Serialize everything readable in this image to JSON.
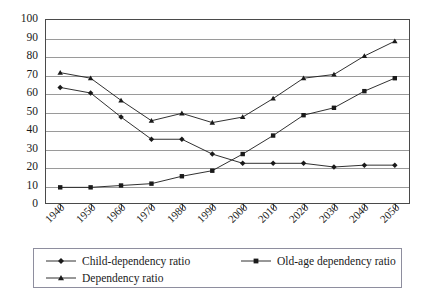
{
  "chart_data": {
    "type": "line",
    "title": "",
    "xlabel": "",
    "ylabel": "",
    "ylim": [
      0,
      100
    ],
    "ytick_step": 10,
    "grid": true,
    "legend_position": "bottom",
    "categories": [
      "1940",
      "1950",
      "1960",
      "1970",
      "1980",
      "1990",
      "2000",
      "2010",
      "2020",
      "2030",
      "2040",
      "2050"
    ],
    "yticks": [
      "0",
      "10",
      "20",
      "30",
      "40",
      "50",
      "60",
      "70",
      "80",
      "90",
      "100"
    ],
    "series": [
      {
        "name": "Child-dependency ratio",
        "marker": "diamond",
        "values": [
          63,
          60,
          47,
          35,
          35,
          27,
          22,
          22,
          22,
          20,
          21,
          21
        ]
      },
      {
        "name": "Old-age dependency ratio",
        "marker": "square",
        "values": [
          9,
          9,
          10,
          11,
          15,
          18,
          27,
          37,
          48,
          52,
          61,
          68
        ]
      },
      {
        "name": "Dependency ratio",
        "marker": "triangle",
        "values": [
          71,
          68,
          56,
          45,
          49,
          44,
          47,
          57,
          68,
          70,
          80,
          88
        ]
      }
    ]
  },
  "colors": {
    "line": "#1a1a1a",
    "grid": "#9a9a9a",
    "frame": "#4a4a4a",
    "legend_border": "#8e8e9e",
    "background": "#ffffff"
  }
}
